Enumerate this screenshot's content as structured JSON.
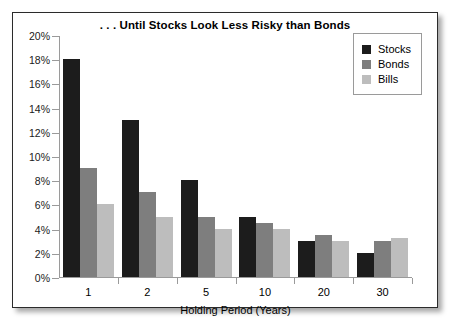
{
  "chart_data": {
    "type": "bar",
    "title": ". . . Until Stocks Look Less Risky than Bonds",
    "xlabel": "Holding Period (Years)",
    "ylabel": "",
    "categories": [
      "1",
      "2",
      "5",
      "10",
      "20",
      "30"
    ],
    "ylim": [
      0,
      20
    ],
    "ytick_step": 2,
    "ytick_labels": [
      "20%",
      "18%",
      "16%",
      "14%",
      "12%",
      "10%",
      "8%",
      "6%",
      "4%",
      "2%",
      "0%"
    ],
    "ytick_values": [
      20,
      18,
      16,
      14,
      12,
      10,
      8,
      6,
      4,
      2,
      0
    ],
    "grid": false,
    "legend_position": "top-right",
    "series": [
      {
        "name": "Stocks",
        "color": "#1c1c1c",
        "values": [
          18,
          13,
          8,
          5,
          3,
          2
        ]
      },
      {
        "name": "Bonds",
        "color": "#7e7e7e",
        "values": [
          9,
          7,
          5,
          4.5,
          3.5,
          3
        ]
      },
      {
        "name": "Bills",
        "color": "#bdbdbd",
        "values": [
          6,
          5,
          4,
          4,
          3,
          3.2
        ]
      }
    ]
  },
  "legend": {
    "items": [
      {
        "label": "Stocks",
        "swatch": "legend-swatch-stocks"
      },
      {
        "label": "Bonds",
        "swatch": "legend-swatch-bonds"
      },
      {
        "label": "Bills",
        "swatch": "legend-swatch-bills"
      }
    ]
  }
}
